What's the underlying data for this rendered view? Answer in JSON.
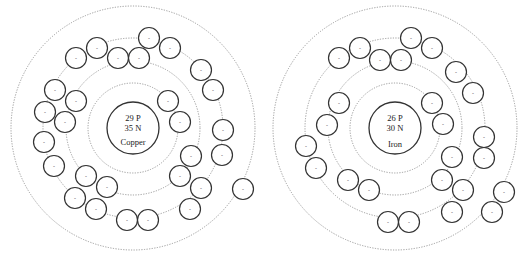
{
  "atoms": [
    {
      "element": "Copper",
      "protons_label": "29 P",
      "neutrons_label": "35 N",
      "electron_sign": "-",
      "shells": [
        2,
        8,
        18,
        1
      ],
      "electron_count": 29
    },
    {
      "element": "Iron",
      "protons_label": "26 P",
      "neutrons_label": "30 N",
      "electron_sign": "-",
      "shells": [
        2,
        8,
        14,
        2
      ],
      "electron_count": 26
    }
  ]
}
